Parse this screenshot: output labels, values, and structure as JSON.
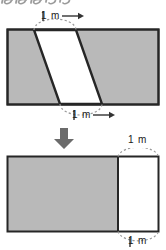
{
  "figure": {
    "title_fragment": "handwritten-scrap",
    "colors": {
      "fill_gray": "#b9b9b9",
      "fill_white": "#ffffff",
      "outline": "#262626",
      "dashed": "#9a9a9a",
      "text": "#1a1a1a",
      "arrow": "#555555",
      "background": "#ffffff"
    },
    "top_figure": {
      "name": "parallelogram-in-rectangle",
      "rect": {
        "x": 7,
        "y": 29,
        "w": 152,
        "h": 76
      },
      "slant_strip": {
        "top_left_x": 34,
        "top_right_x": 76,
        "bottom_left_x": 60,
        "bottom_right_x": 102,
        "fill": "white"
      },
      "labels": {
        "top": "1 m",
        "top_arrow": "right-arrow",
        "bottom": "1 m",
        "bottom_arrow": "right-arrow"
      },
      "dashed_arcs": [
        "top-arc",
        "bottom-arc"
      ]
    },
    "transform_arrow": {
      "name": "down-arrow",
      "direction": "down",
      "x": 61,
      "y": 132
    },
    "bottom_figure": {
      "name": "rectangle-with-unit-column",
      "rect": {
        "x": 7,
        "y": 156,
        "w": 152,
        "h": 76
      },
      "divider_x": 118,
      "gray_part": {
        "x": 7,
        "w": 111
      },
      "white_part": {
        "x": 118,
        "w": 41
      },
      "labels": {
        "top": "1 m",
        "bottom": "1 m"
      },
      "dashed_arcs": [
        "top-arc",
        "bottom-arc"
      ]
    }
  },
  "measurements": {
    "unit": "m",
    "value": "1",
    "combined": "1 m"
  }
}
